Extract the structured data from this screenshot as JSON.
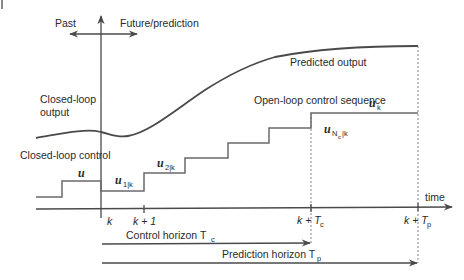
{
  "diagram": {
    "regions": {
      "past_label": "Past",
      "future_label": "Future/prediction"
    },
    "signals": {
      "closed_loop_output_line1": "Closed-loop",
      "closed_loop_output_line2": "output",
      "predicted_output": "Predicted output",
      "open_loop_sequence": "Open-loop control sequence",
      "closed_loop_control": "Closed-loop control"
    },
    "control_symbols": {
      "u": "u",
      "u1": "u",
      "u1_sub": "1|k",
      "u2": "u",
      "u2_sub": "2|k",
      "uNc": "u",
      "uNc_sub_N": "N",
      "uNc_sub_c": "c",
      "uNc_sub_k": "|k",
      "uk": "u",
      "uk_sub": "k"
    },
    "time_axis": {
      "label": "time",
      "ticks": [
        {
          "label": "k",
          "x": 101
        },
        {
          "label": "k + 1",
          "x": 144
        },
        {
          "label": "k + T",
          "sub": "c",
          "x": 311
        },
        {
          "label": "k + T",
          "sub": "p",
          "x": 418
        }
      ]
    },
    "horizons": {
      "control": {
        "label": "Control horizon T",
        "sub": "c"
      },
      "prediction": {
        "label": "Prediction horizon T",
        "sub": "p"
      }
    },
    "colors": {
      "line": "#4a4a4a",
      "step": "#6a6a6a",
      "text": "#2a2a2a"
    }
  }
}
